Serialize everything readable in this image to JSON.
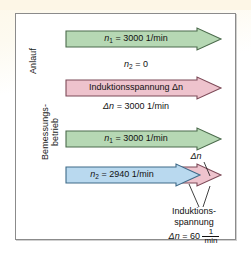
{
  "figure": {
    "type": "diagram"
  },
  "sections": {
    "upper": {
      "label": "Anlauf",
      "arrows": [
        {
          "name": "n1-arrow-anlauf",
          "label": "n_1 = 3000 1/min",
          "symbol": "n",
          "subscript": "1",
          "value": "3000 1/min",
          "color": "#b6d8b4"
        },
        {
          "name": "induktionsspannung-arrow-anlauf",
          "label": "Induktionsspannung Δn",
          "value": "Δn = 3000 1/min",
          "color": "#eec3cd"
        }
      ],
      "static_text": {
        "n2_zero": "n_2 = 0",
        "n2_symbol": "n",
        "n2_subscript": "2",
        "n2_value": "0"
      },
      "caption_below_pink": {
        "symbol": "Δn",
        "equals": "=",
        "value": "3000 1/min"
      }
    },
    "lower": {
      "label_line1": "Bemessungs-",
      "label_line2": "betrieb",
      "arrows": [
        {
          "name": "n1-arrow-bemessung",
          "label": "n_1 = 3000 1/min",
          "symbol": "n",
          "subscript": "1",
          "value": "3000 1/min",
          "color": "#b6d8b4"
        },
        {
          "name": "n2-arrow-bemessung",
          "label": "n_2 = 2940 1/min",
          "symbol": "n",
          "subscript": "2",
          "value": "2940 1/min",
          "color": "#b9d9ef"
        },
        {
          "name": "delta-n-arrow",
          "label": "Δn",
          "color": "#eec3cd"
        }
      ],
      "delta_label": "Δn",
      "callout_line1": "Induktions-",
      "callout_line2": "spannung",
      "formula": {
        "symbol": "Δn",
        "equals": "=",
        "value": "60",
        "unit_numerator": "1",
        "unit_denominator": "min"
      }
    }
  },
  "colors": {
    "green": "#b6d8b4",
    "green_stroke": "#4b6b4c",
    "pink": "#eec3cd",
    "pink_stroke": "#7d4a58",
    "blue": "#b9d9ef",
    "blue_stroke": "#3f6a88",
    "frame_border": "#8b8b8b",
    "text": "#111111",
    "page_background": "#ffffff",
    "top_band": "#fdf6e6"
  }
}
